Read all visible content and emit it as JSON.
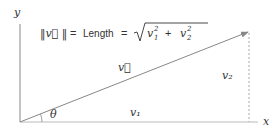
{
  "diagram": {
    "axes": {
      "x_label": "x",
      "y_label": "y"
    },
    "vector": {
      "label": "v⃗",
      "arrow_color": "#888888"
    },
    "components": {
      "horizontal": "v₁",
      "vertical": "v₂"
    },
    "angle": {
      "label": "θ"
    },
    "formula": {
      "lhs": "‖v⃗ ‖",
      "eq1": "=",
      "word": "Length",
      "eq2": "=",
      "sqrt_symbol": "√",
      "radicand_a": "v",
      "radicand_a_sup": "2",
      "radicand_a_sub": "1",
      "plus": "+",
      "radicand_b": "v",
      "radicand_b_sup": "2",
      "radicand_b_sub": "2"
    },
    "colors": {
      "axis": "#888888",
      "text": "#333333",
      "dashed": "#aaaaaa"
    }
  }
}
